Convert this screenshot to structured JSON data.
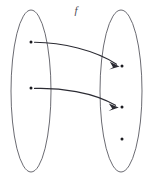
{
  "diagram": {
    "title_label": "f",
    "type": "function-mapping-diagram",
    "canvas": {
      "width": 151,
      "height": 178,
      "background": "#ffffff"
    },
    "stroke_colors": {
      "ellipse": "#5a5a62",
      "arrow": "#2b2b33",
      "dot": "#1b1b20",
      "label": "#4a4a52"
    },
    "sets": [
      {
        "name": "domain-set",
        "label": "",
        "center_x": 31,
        "center_y": 91,
        "radius_x": 20,
        "radius_y": 81,
        "elements": [
          {
            "name": "domain-element-1",
            "label": "",
            "cx": 31,
            "cy": 42
          },
          {
            "name": "domain-element-2",
            "label": "",
            "cx": 31,
            "cy": 88
          }
        ]
      },
      {
        "name": "codomain-set",
        "label": "",
        "center_x": 121,
        "center_y": 91,
        "radius_x": 21,
        "radius_y": 81,
        "elements": [
          {
            "name": "codomain-element-1",
            "label": "",
            "cx": 122,
            "cy": 66
          },
          {
            "name": "codomain-element-2",
            "label": "",
            "cx": 122,
            "cy": 107
          },
          {
            "name": "codomain-element-3",
            "label": "",
            "cx": 122,
            "cy": 139
          }
        ]
      }
    ],
    "mappings": [
      {
        "name": "mapping-arrow-1",
        "from": "domain-element-1",
        "to": "codomain-element-1",
        "path": "M 34.5 42.3 C 62 42.5 95 50 116.5 64.2",
        "head": "M 118.8 65.8 L 110.6 62.4 L 113.2 67.6 L 110.0 69.0 Z"
      },
      {
        "name": "mapping-arrow-2",
        "from": "domain-element-2",
        "to": "codomain-element-2",
        "path": "M 34.5 88.4 C 60 87.6 93 92 115.5 105.3",
        "head": "M 118.0 106.9 L 109.6 103.9 L 112.4 108.9 L 109.4 110.6 Z"
      }
    ],
    "label_position": {
      "x": 76,
      "y": 14
    }
  }
}
